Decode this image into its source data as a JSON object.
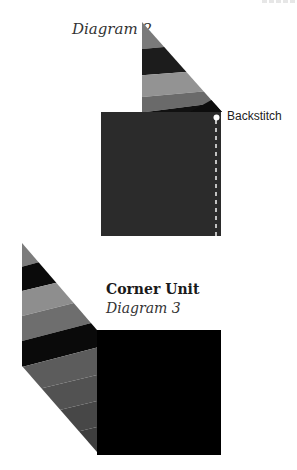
{
  "diagram2": {
    "title": "Diagram 2",
    "callout_label": "Backstitch",
    "colors": {
      "square": "#2b2b2b",
      "stripe_gray": "#7a7a7a",
      "stripe_black": "#1c1c1c",
      "stripe_light": "#939393",
      "stripe_mid": "#6a6a6a",
      "stitch_line": "#e8e8e8"
    }
  },
  "diagram3": {
    "heading": "Corner Unit",
    "title": "Diagram 3",
    "colors": {
      "square": "#000000",
      "stripe_gray": "#7c7c7c",
      "stripe_black": "#0a0a0a",
      "stripe_light": "#8e8e8e",
      "stripe_mid": "#6e6e6e",
      "stripe_dark1": "#5a5a5a",
      "stripe_dark2": "#4a4a4a",
      "stripe_dark3": "#3e3e3e"
    }
  }
}
